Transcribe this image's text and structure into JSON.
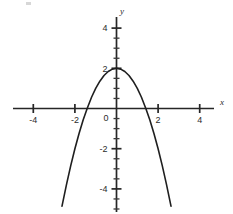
{
  "chart_data": {
    "type": "line",
    "title": "",
    "subtitle": "",
    "xlabel": "x",
    "ylabel": "y",
    "xlim": [
      -5.6,
      5.7
    ],
    "ylim": [
      -5.2,
      4.8
    ],
    "grid": false,
    "legend": null,
    "equation": "y = 2 - x^2",
    "vertex": [
      0,
      2
    ],
    "x_intercepts": [
      -1.41,
      1.41
    ],
    "y_intercept": 2,
    "opens": "down",
    "x_ticks": [
      {
        "value": -4,
        "label": "-4",
        "type": "major"
      },
      {
        "value": -2,
        "label": "-2",
        "type": "major"
      },
      {
        "value": 0,
        "label": "0",
        "type": "origin"
      },
      {
        "value": 2,
        "label": "2",
        "type": "major"
      },
      {
        "value": 4,
        "label": "4",
        "type": "major"
      }
    ],
    "y_ticks": [
      {
        "value": 4,
        "label": "4",
        "type": "major"
      },
      {
        "value": 3.5,
        "label": "",
        "type": "minor"
      },
      {
        "value": 3,
        "label": "",
        "type": "minor"
      },
      {
        "value": 2.5,
        "label": "",
        "type": "minor"
      },
      {
        "value": 2,
        "label": "2",
        "type": "major"
      },
      {
        "value": 1.5,
        "label": "",
        "type": "minor"
      },
      {
        "value": 1,
        "label": "",
        "type": "minor"
      },
      {
        "value": 0.5,
        "label": "",
        "type": "minor"
      },
      {
        "value": -0.5,
        "label": "",
        "type": "minor"
      },
      {
        "value": -1,
        "label": "",
        "type": "minor"
      },
      {
        "value": -1.5,
        "label": "",
        "type": "minor"
      },
      {
        "value": -2,
        "label": "-2",
        "type": "major"
      },
      {
        "value": -2.5,
        "label": "",
        "type": "minor"
      },
      {
        "value": -3,
        "label": "",
        "type": "minor"
      },
      {
        "value": -3.5,
        "label": "",
        "type": "minor"
      },
      {
        "value": -4,
        "label": "-4",
        "type": "major"
      },
      {
        "value": -4.5,
        "label": "",
        "type": "minor"
      },
      {
        "value": -5,
        "label": "",
        "type": "minor"
      }
    ],
    "series": [
      {
        "name": "y = 2 - x^2",
        "color": "#1f1f1f",
        "x": [
          -2.62,
          -2.4,
          -2.2,
          -2.0,
          -1.8,
          -1.6,
          -1.41,
          -1.2,
          -1.0,
          -0.8,
          -0.6,
          -0.4,
          -0.2,
          0.0,
          0.2,
          0.4,
          0.6,
          0.8,
          1.0,
          1.2,
          1.41,
          1.6,
          1.8,
          2.0,
          2.2,
          2.4,
          2.62
        ],
        "values": [
          -4.86,
          -3.76,
          -2.84,
          -2.0,
          -1.24,
          -0.56,
          0.0,
          0.56,
          1.0,
          1.36,
          1.64,
          1.84,
          1.96,
          2.0,
          1.96,
          1.84,
          1.64,
          1.36,
          1.0,
          0.56,
          0.0,
          -0.56,
          -1.24,
          -2.0,
          -2.84,
          -3.76,
          -4.86
        ]
      }
    ],
    "axis_labels": {
      "x_axis_name": "x",
      "y_axis_name": "y",
      "origin_label": "0"
    },
    "colors": {
      "axis": "#262626",
      "curve": "#1f1f1f",
      "text": "#2b2b2b",
      "background": "#ffffff"
    }
  }
}
